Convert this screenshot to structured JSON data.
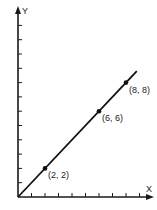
{
  "chart_data": {
    "type": "line",
    "title": "",
    "xlabel": "X",
    "ylabel": "Y",
    "xlim": [
      0,
      10
    ],
    "ylim": [
      0,
      13
    ],
    "x_ticks": [
      1,
      2,
      3,
      4,
      5,
      6,
      7,
      8,
      9
    ],
    "y_ticks": [
      1,
      2,
      3,
      4,
      5,
      6,
      7,
      8,
      9,
      10,
      11,
      12
    ],
    "grid": false,
    "series": [
      {
        "name": "y = x",
        "line_from": [
          0,
          0
        ],
        "line_to": [
          8.8,
          8.8
        ],
        "points": [
          {
            "x": 2,
            "y": 2,
            "label": "(2, 2)"
          },
          {
            "x": 6,
            "y": 6,
            "label": "(6, 6)"
          },
          {
            "x": 8,
            "y": 8,
            "label": "(8, 8)"
          }
        ]
      }
    ],
    "colors": {
      "line": "#111111",
      "axis": "#1a1a1a"
    }
  }
}
